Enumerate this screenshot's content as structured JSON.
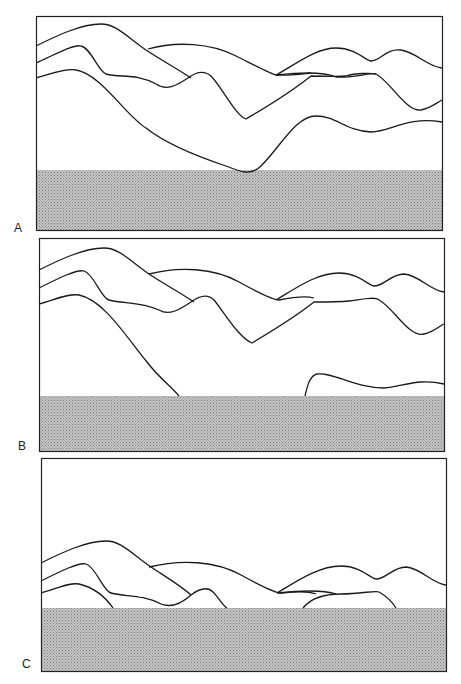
{
  "figure": {
    "panels": [
      {
        "label": "A",
        "description": "Mountain ridges with low ground band",
        "ground_top": 154
      },
      {
        "label": "B",
        "description": "Ground band rising, lower ridges clipped",
        "ground_top": 158
      },
      {
        "label": "C",
        "description": "Ground band high, only upper ridges visible",
        "ground_top": 145
      }
    ],
    "colors": {
      "frame": "#222222",
      "ridge": "#1a1a1a",
      "ground": "#b8b8b8",
      "ground_dots": "#8a8a8a"
    }
  }
}
